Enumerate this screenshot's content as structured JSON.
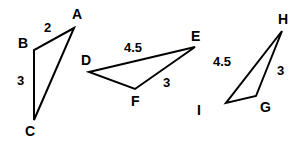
{
  "triangles": [
    {
      "name": "ABC",
      "vertices": [
        {
          "label": "A",
          "x": 74,
          "y": 28,
          "lx": 72,
          "ly": 19
        },
        {
          "label": "B",
          "x": 34,
          "y": 50,
          "lx": 18,
          "ly": 48
        },
        {
          "label": "C",
          "x": 34,
          "y": 120,
          "lx": 25,
          "ly": 136
        }
      ],
      "sides": [
        {
          "between": "AB",
          "length": "2",
          "lx": 44,
          "ly": 32
        },
        {
          "between": "BC",
          "length": "3",
          "lx": 17,
          "ly": 85
        }
      ]
    },
    {
      "name": "DEF",
      "vertices": [
        {
          "label": "D",
          "x": 89,
          "y": 72,
          "lx": 81,
          "ly": 65
        },
        {
          "label": "E",
          "x": 195,
          "y": 47,
          "lx": 191,
          "ly": 41
        },
        {
          "label": "F",
          "x": 135,
          "y": 89,
          "lx": 131,
          "ly": 106
        }
      ],
      "sides": [
        {
          "between": "DE",
          "length": "4.5",
          "lx": 124,
          "ly": 52
        },
        {
          "between": "EF",
          "length": "3",
          "lx": 163,
          "ly": 87
        }
      ]
    },
    {
      "name": "GHI",
      "vertices": [
        {
          "label": "H",
          "x": 282,
          "y": 31,
          "lx": 278,
          "ly": 24
        },
        {
          "label": "G",
          "x": 256,
          "y": 96,
          "lx": 260,
          "ly": 112
        },
        {
          "label": "I",
          "x": 226,
          "y": 103,
          "lx": 197,
          "ly": 115
        }
      ],
      "sides": [
        {
          "between": "HI",
          "length": "4.5",
          "lx": 213,
          "ly": 66
        },
        {
          "between": "HG",
          "length": "3",
          "lx": 277,
          "ly": 75
        }
      ]
    }
  ]
}
